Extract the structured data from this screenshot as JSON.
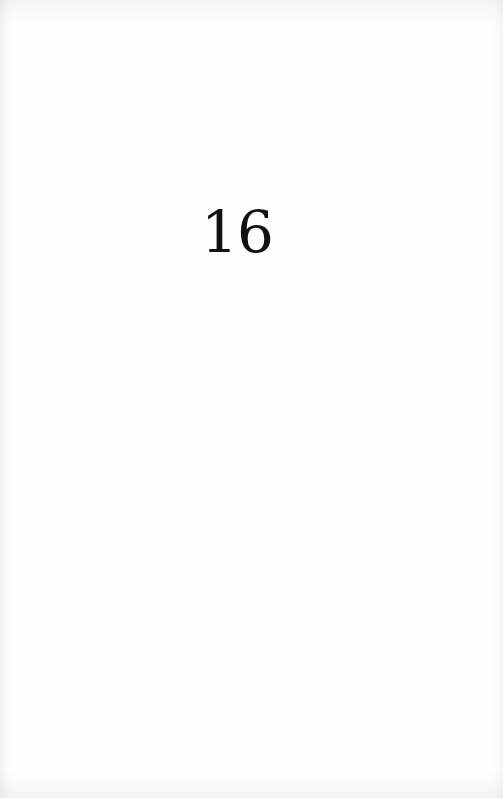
{
  "document": {
    "type": "scanned-book-page",
    "page_number": "16",
    "background_color": "#fefefe",
    "text_color": "#111111"
  }
}
